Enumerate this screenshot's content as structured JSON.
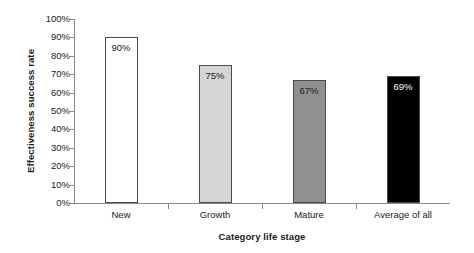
{
  "chart_data": {
    "type": "bar",
    "title": "",
    "xlabel": "Category life stage",
    "ylabel": "Effectiveness success rate",
    "categories": [
      "New",
      "Growth",
      "Mature",
      "Average of all"
    ],
    "values": [
      90,
      75,
      67,
      69
    ],
    "value_labels": [
      "90%",
      "75%",
      "67%",
      "69%"
    ],
    "ylim": [
      0,
      100
    ],
    "ytick_labels": [
      "100%",
      "90%",
      "80%",
      "70%",
      "60%",
      "50%",
      "40%",
      "30%",
      "20%",
      "10%",
      "0%"
    ],
    "ytick_values": [
      100,
      90,
      80,
      70,
      60,
      50,
      40,
      30,
      20,
      10,
      0
    ],
    "grid": false,
    "legend": false,
    "bar_colors": [
      "#ffffff",
      "#d5d5d5",
      "#909090",
      "#000000"
    ],
    "bar_border_color": "#4a4a4a",
    "bar_label_colors": [
      "#1a1a1a",
      "#1a1a1a",
      "#1a1a1a",
      "#ffffff"
    ],
    "axis_color": "#8a8a8a",
    "background_color": "#ffffff"
  }
}
